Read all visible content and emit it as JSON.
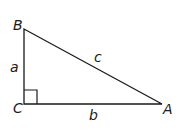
{
  "diagram": {
    "vertices": [
      {
        "name": "B",
        "label": "B",
        "x": 24,
        "y": 29
      },
      {
        "name": "C",
        "label": "C",
        "x": 24,
        "y": 104
      },
      {
        "name": "A",
        "label": "A",
        "x": 162,
        "y": 104
      }
    ],
    "sides": [
      {
        "name": "a",
        "label": "a",
        "from": "B",
        "to": "C"
      },
      {
        "name": "b",
        "label": "b",
        "from": "C",
        "to": "A"
      },
      {
        "name": "c",
        "label": "c",
        "from": "B",
        "to": "A"
      }
    ],
    "right_angle_at": "C",
    "stroke_color": "#1a1a1a"
  }
}
